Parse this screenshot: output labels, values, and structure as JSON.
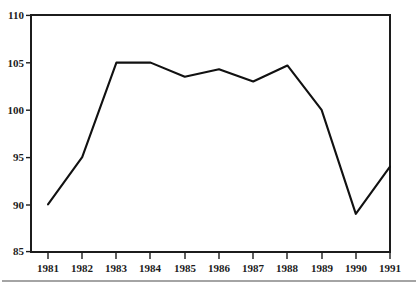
{
  "chart_data": {
    "type": "line",
    "title": "",
    "subtitle": "",
    "xlabel": "",
    "ylabel": "",
    "categories": [
      "1981",
      "1982",
      "1983",
      "1984",
      "1985",
      "1986",
      "1987",
      "1988",
      "1989",
      "1990",
      "1991"
    ],
    "values": [
      90,
      95,
      105,
      105,
      103.5,
      104.3,
      103,
      104.7,
      100,
      89,
      94
    ],
    "x": [
      1981,
      1982,
      1983,
      1984,
      1985,
      1986,
      1987,
      1988,
      1989,
      1990,
      1991
    ],
    "xlim": [
      1981,
      1991
    ],
    "ylim": [
      85,
      110
    ],
    "y_ticks": [
      85,
      90,
      95,
      100,
      105,
      110
    ],
    "y_tick_labels": [
      "85",
      "90",
      "95",
      "100",
      "105",
      "110"
    ],
    "x_ticks": [
      1981,
      1982,
      1983,
      1984,
      1985,
      1986,
      1987,
      1988,
      1989,
      1990,
      1991
    ],
    "x_tick_labels": [
      "1981",
      "1982",
      "1983",
      "1984",
      "1985",
      "1986",
      "1987",
      "1988",
      "1989",
      "1990",
      "1991"
    ],
    "grid": false,
    "legend": false,
    "legend_position": "none",
    "series": [
      {
        "name": "series-1",
        "values": [
          90,
          95,
          105,
          105,
          103.5,
          104.3,
          103,
          104.7,
          100,
          89,
          94
        ]
      }
    ],
    "annotations": [],
    "colors": {
      "line": "#111111",
      "axis": "#1c1c1c",
      "background": "#ffffff",
      "text": "#1c1c1c"
    }
  },
  "figure": {
    "footer_rule_visible": true
  }
}
